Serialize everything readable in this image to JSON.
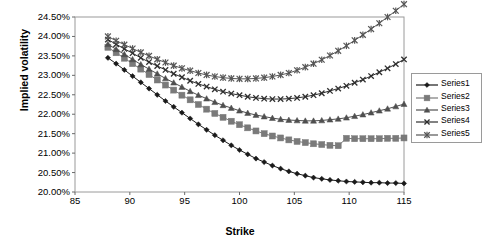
{
  "chart_data": {
    "type": "line",
    "title": "",
    "xlabel": "Strike",
    "ylabel": "Implied volatility",
    "xlim": [
      85,
      115
    ],
    "ylim": [
      0.2,
      0.245
    ],
    "xticks": [
      85,
      90,
      95,
      100,
      105,
      110,
      115
    ],
    "xticklabels": [
      "85",
      "90",
      "95",
      "100",
      "105",
      "110",
      "115"
    ],
    "yticks": [
      0.2,
      0.205,
      0.21,
      0.215,
      0.22,
      0.225,
      0.23,
      0.235,
      0.24,
      0.245
    ],
    "yticklabels": [
      "20.00%",
      "20.50%",
      "21.00%",
      "21.50%",
      "22.00%",
      "22.50%",
      "23.00%",
      "23.50%",
      "24.00%",
      "24.50%"
    ],
    "grid": false,
    "legend_position": "right",
    "x": [
      88.0,
      88.75,
      89.5,
      90.25,
      91.0,
      91.75,
      92.5,
      93.25,
      94.0,
      94.75,
      95.5,
      96.25,
      97.0,
      97.75,
      98.5,
      99.25,
      100.0,
      100.75,
      101.5,
      102.25,
      103.0,
      103.75,
      104.5,
      105.25,
      106.0,
      106.75,
      107.5,
      108.25,
      109.0,
      109.75,
      110.5,
      111.25,
      112.0,
      112.75,
      113.5,
      114.25,
      115.0
    ],
    "series": [
      {
        "name": "Series1",
        "marker": "diamond",
        "color": "#1a1a1a",
        "values": [
          0.2345,
          0.233,
          0.2314,
          0.2298,
          0.2282,
          0.2266,
          0.225,
          0.2234,
          0.2219,
          0.2204,
          0.2189,
          0.2174,
          0.216,
          0.2146,
          0.2133,
          0.212,
          0.2108,
          0.2097,
          0.2086,
          0.2077,
          0.2068,
          0.206,
          0.2053,
          0.2047,
          0.2042,
          0.2037,
          0.2034,
          0.2031,
          0.2029,
          0.2027,
          0.2026,
          0.2025,
          0.2024,
          0.2024,
          0.2023,
          0.2023,
          0.2022
        ]
      },
      {
        "name": "Series2",
        "marker": "square",
        "color": "#7a7a7a",
        "values": [
          0.2372,
          0.2358,
          0.2344,
          0.233,
          0.2316,
          0.2302,
          0.2288,
          0.2275,
          0.2262,
          0.2249,
          0.2237,
          0.2225,
          0.2213,
          0.2202,
          0.2192,
          0.2182,
          0.2173,
          0.2165,
          0.2157,
          0.215,
          0.2144,
          0.2139,
          0.2134,
          0.213,
          0.2127,
          0.2124,
          0.2122,
          0.212,
          0.2119,
          0.2138,
          0.2137,
          0.2137,
          0.2137,
          0.2137,
          0.2138,
          0.2138,
          0.2139
        ]
      },
      {
        "name": "Series3",
        "marker": "triangle",
        "color": "#4f4f4f",
        "values": [
          0.238,
          0.2367,
          0.2354,
          0.2341,
          0.2328,
          0.2316,
          0.2304,
          0.2292,
          0.2281,
          0.227,
          0.2259,
          0.2249,
          0.224,
          0.2231,
          0.2223,
          0.2216,
          0.2209,
          0.2203,
          0.2198,
          0.2194,
          0.219,
          0.2187,
          0.2185,
          0.2184,
          0.2183,
          0.2183,
          0.2184,
          0.2186,
          0.2188,
          0.2191,
          0.2195,
          0.2199,
          0.2204,
          0.2209,
          0.2214,
          0.222,
          0.2226
        ]
      },
      {
        "name": "Series4",
        "marker": "x",
        "color": "#2e2e2e",
        "values": [
          0.2392,
          0.238,
          0.2368,
          0.2357,
          0.2345,
          0.2334,
          0.2324,
          0.2314,
          0.2304,
          0.2295,
          0.2286,
          0.2278,
          0.2271,
          0.2264,
          0.2258,
          0.2253,
          0.2249,
          0.2245,
          0.2242,
          0.224,
          0.2239,
          0.2239,
          0.224,
          0.2242,
          0.2245,
          0.2249,
          0.2254,
          0.226,
          0.2266,
          0.2273,
          0.2281,
          0.2289,
          0.2298,
          0.2308,
          0.2318,
          0.2329,
          0.2341
        ]
      },
      {
        "name": "Series5",
        "marker": "asterisk",
        "color": "#555555",
        "values": [
          0.24,
          0.2389,
          0.2379,
          0.2369,
          0.2359,
          0.235,
          0.2341,
          0.2333,
          0.2325,
          0.2318,
          0.2312,
          0.2306,
          0.2301,
          0.2297,
          0.2294,
          0.2292,
          0.2291,
          0.2291,
          0.2292,
          0.2294,
          0.2297,
          0.2301,
          0.2306,
          0.2313,
          0.2321,
          0.233,
          0.234,
          0.2351,
          0.2363,
          0.2376,
          0.239,
          0.2404,
          0.2419,
          0.2434,
          0.245,
          0.2466,
          0.2483
        ]
      }
    ]
  },
  "legend": {
    "items": [
      "Series1",
      "Series2",
      "Series3",
      "Series4",
      "Series5"
    ]
  },
  "axes": {
    "xlabel": "Strike",
    "ylabel": "Implied volatility"
  }
}
